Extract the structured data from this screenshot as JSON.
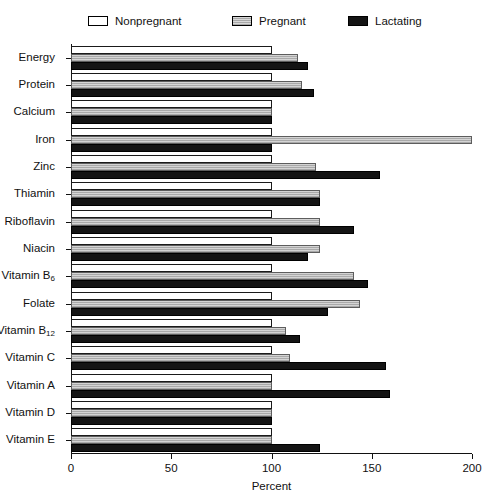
{
  "legend": {
    "entries": [
      {
        "label": "Nonpregnant",
        "key": "nonpregnant",
        "swatch": "legend-swatch-nonpregnant",
        "color": "#ffffff",
        "x": 88
      },
      {
        "label": "Pregnant",
        "key": "pregnant",
        "swatch": "legend-swatch-pregnant",
        "color": "#a9a9a9",
        "x": 232
      },
      {
        "label": "Lactating",
        "key": "lactating",
        "swatch": "legend-swatch-lactating",
        "color": "#141414",
        "x": 348
      }
    ]
  },
  "chart_data": {
    "type": "bar",
    "orientation": "horizontal",
    "title": "",
    "xlabel": "Percent",
    "ylabel": "",
    "xlim": [
      0,
      200
    ],
    "xticks": [
      0,
      50,
      100,
      150,
      200
    ],
    "xtick_labels": [
      "0",
      "50",
      "100",
      "150",
      "200"
    ],
    "grid": false,
    "legend_position": "top",
    "categories": [
      "Energy",
      "Protein",
      "Calcium",
      "Iron",
      "Zinc",
      "Thiamin",
      "Riboflavin",
      "Niacin",
      "Vitamin B6",
      "Folate",
      "Vitamin B12",
      "Vitamin C",
      "Vitamin A",
      "Vitamin D",
      "Vitamin E"
    ],
    "category_labels_html": [
      "Energy",
      "Protein",
      "Calcium",
      "Iron",
      "Zinc",
      "Thiamin",
      "Riboflavin",
      "Niacin",
      "Vitamin B<sub>6</sub>",
      "Folate",
      "Vitamin B<sub>12</sub>",
      "Vitamin C",
      "Vitamin A",
      "Vitamin D",
      "Vitamin E"
    ],
    "series": [
      {
        "name": "Nonpregnant",
        "color": "#ffffff",
        "values": [
          100,
          100,
          100,
          100,
          100,
          100,
          100,
          100,
          100,
          100,
          100,
          100,
          100,
          100,
          100
        ]
      },
      {
        "name": "Pregnant",
        "color": "#a9a9a9",
        "values": [
          113,
          115,
          100,
          200,
          122,
          124,
          124,
          124,
          141,
          144,
          107,
          109,
          100,
          100,
          100
        ]
      },
      {
        "name": "Lactating",
        "color": "#141414",
        "values": [
          118,
          121,
          100,
          100,
          154,
          124,
          141,
          118,
          148,
          128,
          114,
          157,
          159,
          100,
          124
        ]
      }
    ]
  }
}
